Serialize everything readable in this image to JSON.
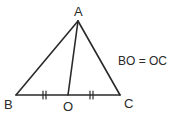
{
  "diagram": {
    "type": "geometry-triangle",
    "points": {
      "A": {
        "label": "A",
        "x": 78,
        "y": 21
      },
      "B": {
        "label": "B",
        "x": 16,
        "y": 95
      },
      "C": {
        "label": "C",
        "x": 120,
        "y": 95
      },
      "O": {
        "label": "O",
        "x": 68,
        "y": 95
      }
    },
    "segments": [
      "AB",
      "AC",
      "BC",
      "AO"
    ],
    "equal_marks": [
      "BO",
      "OC"
    ],
    "annotation": "BO = OC",
    "stroke_color": "#2a2a2a"
  }
}
